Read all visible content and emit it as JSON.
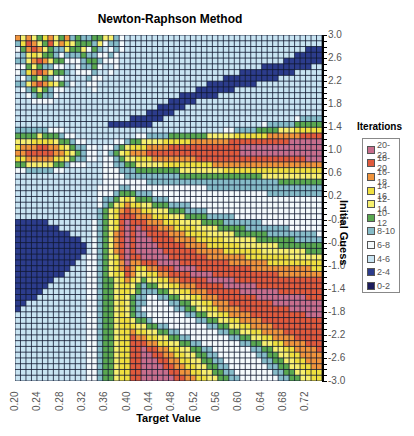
{
  "chart_data": {
    "type": "heatmap",
    "title": "Newton-Raphson Method",
    "xlabel": "Target Value",
    "ylabel": "Initial Guess",
    "legend_title": "Iterations",
    "xlim": [
      0.2,
      0.75
    ],
    "ylim": [
      -3.0,
      3.0
    ],
    "x_ticks": [
      "0.20",
      "0.24",
      "0.28",
      "0.32",
      "0.36",
      "0.40",
      "0.44",
      "0.48",
      "0.52",
      "0.56",
      "0.60",
      "0.64",
      "0.68",
      "0.72"
    ],
    "y_ticks": [
      "3.0",
      "2.6",
      "2.2",
      "1.8",
      "1.4",
      "1.0",
      "0.6",
      "0.2",
      "-0.2",
      "-0.6",
      "-1.0",
      "-1.4",
      "-1.8",
      "-2.2",
      "-2.6",
      "-3.0"
    ],
    "legend_position": "right",
    "grid": [
      "86865786584544556643222222222222222222222222222222222222",
      "47986596876555463443222222222222222222222222222222222222",
      "35898654465563542343222222222222222222222222222222222111",
      "24676554344454433432222222222222222222222222222222211111",
      "44689865533345543332222222222222222222222222222221111111",
      "33565443322344532232222222222222222222222222211111111122",
      "34789865542333422322222222222222222222222111111111122222",
      "23456543322224332222222222222222222222111111111122222222",
      "44689876543223322222222222222222222111111111222222222222",
      "23456543322222322222222222222222211111112222222222222222",
      "22345443222222222222222222222211111112222222222222222222",
      "22233332222222222222222222221111122222222222222222222222",
      "22222222222222222222222222111112222222222222222222222222",
      "22222222222222222222222211111222222222222222222222222222",
      "22222222222222222222211111122222222222222222222222234444",
      "22222222222222222111111112222222222222222222234444455555",
      "44444433322222222222222222222222222222334444555566677777",
      "55556555433222222222223344445555555666667777778888889999",
      "66677776554332222233455666677777888888899999999999aaaaaa",
      "78889988765443323345677788889999999999999aaaaaaaaaaaaaaa",
      "88999998876543323456788899999999999999999aaaaaaaaaaaaaaa",
      "77888887765443323345667778888888899999999999999999999aaa",
      "55666665543332223344556666677777777788888888888888888888",
      "33444443322222223334445555555566666666777777777777777777",
      "22222222222222223333444444444455555555555555566666666666",
      "22222222222222223333333344444444444444444444444455555555",
      "22222222222222233334433333333333333444444444444444444444",
      "22222222222222233345554443333333333333333333334444444444",
      "22222222222222234456765554443333333333333333333333333333",
      "22222222222222234567877665554444333333333333333333333333",
      "22222222222222245678988776665554444333333333333333333333",
      "22222222222222245679998887776665555444443333333333333333",
      "11111122222222345679a99988877766665555444444433333333333",
      "11111111222222345679a9a999888777766665555544444444333333",
      "11111111112222345689a9aa99998887777666665555554444444443",
      "11111111111122345689a9aaa9999888877777666666555555544444",
      "11111111111112345689a9aaaa999998888777777666666655555555",
      "11111111111112345689a9aaaaa99999988888777777766666666555",
      "11111111111123345679a99aaaaa9999999888888877777777666666",
      "11111111111223345678a88999aaaa9999999998888888777777777",
      "11111111112223345678987788999aaaa9999999999888888888887",
      "11111111122223345677986677889999aaaa99999999999988888888",
      "11111112222223345567876566778899999aaaaa9999999999999999",
      "11111122222223345567765455667788899999aaaaaa999999999999",
      "11111222222223345567765444556677888999999aaaaaaa99999999",
      "11112222222223345567654433445566778889999999aaaaaaaaa999",
      "11222222222223345567654433334455667788899999999aaaaaaaaa",
      "12222222222223345567654333333445566778888999999999aaaaaa",
      "22222222222223345567654433333334455667788889999999999aaa",
      "22222222222223345567765543333333344556677888899999999999",
      "22222222222223345567776655443333333445566778888999999999",
      "22222222222223345567787766554433333334455667788889999999",
      "22222222222223345567798877665544333333344556677888899999",
      "22222222222223345567799988776655443333333445566778888999",
      "22222222222223345567799a99887766554433333334455667788889",
      "22222222222223345567799aa9988776655443333333445566778888",
      "22222222222223345567799aaa998877665544333333344556677888",
      "22222222222223345567799aaaa9988776655443333333445566778",
      "22222222222223345567799aaaaa998877665544333333344556677",
      "22222222222223345567799aaaaaa99887766554433333334455667"
    ],
    "bins": [
      {
        "label": "20-22",
        "color": "#c86e8c"
      },
      {
        "label": "18-20",
        "color": "#e05a3c"
      },
      {
        "label": "16-18",
        "color": "#f0943c"
      },
      {
        "label": "14-16",
        "color": "#f0e040"
      },
      {
        "label": "12-14",
        "color": "#f8f070"
      },
      {
        "label": "10-12",
        "color": "#5aa850"
      },
      {
        "label": "8-10",
        "color": "#86bcc8"
      },
      {
        "label": "6-8",
        "color": "#f4fafc"
      },
      {
        "label": "4-6",
        "color": "#c8e4f2"
      },
      {
        "label": "2-4",
        "color": "#2c3c8c"
      },
      {
        "label": "0-2",
        "color": "#1c1c5c"
      }
    ],
    "grid_cols": 56,
    "grid_rows": 60,
    "grid_encoding": "each row top (y=3.0) to bottom (y=-3.0); each char is bin index from lowest: 0=0-2,1=2-4,2=4-6,3=6-8,4=8-10,5=10-12,6=12-14,7=14-16,8=16-18,9=18-20,a=20-22"
  }
}
